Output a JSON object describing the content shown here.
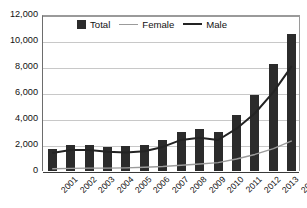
{
  "chart_data": {
    "type": "bar",
    "title": "",
    "subtitle": "",
    "xlabel": "",
    "ylabel": "",
    "ylim": [
      0,
      12000
    ],
    "ytick_step": 2000,
    "grid": true,
    "legend_position": "top-center",
    "categories": [
      "2001",
      "2002",
      "2003",
      "2004",
      "2005",
      "2006",
      "2007",
      "2008",
      "2009",
      "2010",
      "2011",
      "2012",
      "2013",
      "2014"
    ],
    "ytick_labels": [
      "0",
      "2,000",
      "4,000",
      "6,000",
      "8,000",
      "10,000",
      "12,000"
    ],
    "ytick_values": [
      0,
      2000,
      4000,
      6000,
      8000,
      10000,
      12000
    ],
    "series": [
      {
        "name": "Total",
        "type": "bar",
        "color": "#2b2b2b",
        "values": [
          1720,
          2020,
          2000,
          1830,
          1910,
          1970,
          2350,
          2990,
          3250,
          3000,
          4330,
          5870,
          8230,
          10560
        ]
      },
      {
        "name": "Female",
        "type": "line",
        "color": "#9b9b9b",
        "values": [
          250,
          280,
          300,
          300,
          320,
          360,
          420,
          520,
          620,
          720,
          1000,
          1350,
          1800,
          2400
        ]
      },
      {
        "name": "Male",
        "type": "line",
        "color": "#232323",
        "values": [
          1470,
          1700,
          1700,
          1560,
          1500,
          1600,
          1930,
          2470,
          2630,
          2460,
          3330,
          4520,
          6150,
          8150
        ]
      }
    ]
  },
  "legend": {
    "items": [
      {
        "label": "Total",
        "marker": "bar-swatch"
      },
      {
        "label": "Female",
        "marker": "line-swatch-light"
      },
      {
        "label": "Male",
        "marker": "line-swatch-dark"
      }
    ]
  }
}
